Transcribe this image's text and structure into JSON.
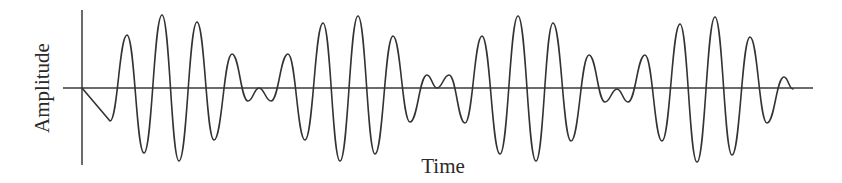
{
  "chart_data": {
    "type": "line",
    "title": "",
    "xlabel": "Time",
    "ylabel": "Amplitude",
    "grid": false,
    "legend": null,
    "axis_ticks": "none",
    "colors": {
      "line": "#333333",
      "axis": "#3a3a3a",
      "background": "#ffffff"
    },
    "pixel_frame": {
      "y_axis_x": 82,
      "y_axis_top": 10,
      "y_axis_bottom": 165,
      "baseline_y": 88,
      "baseline_x_start": 63,
      "baseline_x_end": 813
    },
    "extrema_px": [
      [
        82,
        88
      ],
      [
        110,
        121
      ],
      [
        127,
        35
      ],
      [
        144,
        153
      ],
      [
        162,
        15
      ],
      [
        179,
        161
      ],
      [
        197,
        22
      ],
      [
        214,
        140
      ],
      [
        232,
        54
      ],
      [
        248,
        101
      ],
      [
        259,
        88
      ],
      [
        271,
        101
      ],
      [
        288,
        54
      ],
      [
        305,
        140
      ],
      [
        323,
        23
      ],
      [
        340,
        161
      ],
      [
        358,
        16
      ],
      [
        375,
        154
      ],
      [
        393,
        36
      ],
      [
        410,
        122
      ],
      [
        427,
        75
      ],
      [
        437,
        88
      ],
      [
        449,
        75
      ],
      [
        465,
        123
      ],
      [
        482,
        36
      ],
      [
        500,
        154
      ],
      [
        518,
        16
      ],
      [
        536,
        161
      ],
      [
        553,
        23
      ],
      [
        571,
        141
      ],
      [
        589,
        55
      ],
      [
        605,
        102
      ],
      [
        617,
        89
      ],
      [
        628,
        102
      ],
      [
        645,
        55
      ],
      [
        662,
        141
      ],
      [
        680,
        24
      ],
      [
        697,
        162
      ],
      [
        715,
        17
      ],
      [
        732,
        155
      ],
      [
        750,
        37
      ],
      [
        767,
        123
      ],
      [
        784,
        77
      ],
      [
        793,
        89
      ]
    ]
  },
  "labels": {
    "x": "Time",
    "y": "Amplitude"
  }
}
